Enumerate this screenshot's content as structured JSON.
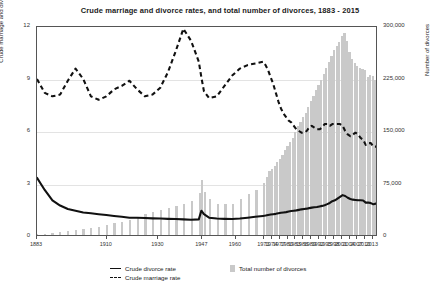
{
  "chart_data": {
    "type": "bar",
    "title": "Crude marriage and divorce rates, and total number of divorces, 1883 - 2015",
    "xlabel": "",
    "ylabel": "Crude marriage and divorce rates",
    "ylabel_right": "Number of divorces",
    "ylim": [
      0,
      12
    ],
    "ylim_right": [
      0,
      300000
    ],
    "yticks": [
      "0",
      "3",
      "6",
      "9",
      "12"
    ],
    "yticks_right": [
      "0",
      "75,000",
      "150,000",
      "225,000",
      "300,000"
    ],
    "xticks": [
      "1883",
      "1910",
      "1930",
      "1947",
      "1960",
      "1971",
      "1974",
      "1977",
      "1980",
      "1983",
      "1986",
      "1989",
      "1992",
      "1995",
      "1998",
      "2001",
      "2004",
      "2007",
      "2010",
      "2013"
    ],
    "xlim": [
      1883,
      2015
    ],
    "grid": true,
    "legend_position": "bottom",
    "colors": {
      "bars": "#c9c9c9",
      "divorce_line": "#111111",
      "marriage_line": "#111111",
      "gridline": "#e3e3e3",
      "frame": "#555555"
    },
    "legend": [
      {
        "label": "Crude divorce rate",
        "marker": "solid-line"
      },
      {
        "label": "Crude marriage rate",
        "marker": "dashed-line"
      },
      {
        "label": "Total number of divorces",
        "marker": "bar-swatch"
      }
    ],
    "x": [
      1883,
      1886,
      1889,
      1892,
      1895,
      1898,
      1901,
      1904,
      1907,
      1910,
      1913,
      1916,
      1919,
      1922,
      1925,
      1928,
      1931,
      1934,
      1937,
      1940,
      1943,
      1946,
      1947,
      1948,
      1950,
      1953,
      1956,
      1959,
      1962,
      1965,
      1968,
      1971,
      1972,
      1973,
      1974,
      1975,
      1976,
      1977,
      1978,
      1979,
      1980,
      1981,
      1982,
      1983,
      1984,
      1985,
      1986,
      1987,
      1988,
      1989,
      1990,
      1991,
      1992,
      1993,
      1994,
      1995,
      1996,
      1997,
      1998,
      1999,
      2000,
      2001,
      2002,
      2003,
      2004,
      2005,
      2006,
      2007,
      2008,
      2009,
      2010,
      2011,
      2012,
      2013,
      2014,
      2015
    ],
    "series": [
      {
        "name": "Crude divorce rate",
        "type": "line",
        "axis": "left",
        "values": [
          3.3,
          2.6,
          2.0,
          1.7,
          1.5,
          1.4,
          1.3,
          1.25,
          1.2,
          1.15,
          1.1,
          1.05,
          1.0,
          1.0,
          0.98,
          0.96,
          0.95,
          0.93,
          0.92,
          0.9,
          0.88,
          0.9,
          1.4,
          1.2,
          1.0,
          0.95,
          0.93,
          0.92,
          0.95,
          1.0,
          1.05,
          1.1,
          1.12,
          1.15,
          1.18,
          1.2,
          1.22,
          1.25,
          1.28,
          1.3,
          1.32,
          1.35,
          1.38,
          1.4,
          1.42,
          1.45,
          1.48,
          1.5,
          1.52,
          1.55,
          1.58,
          1.6,
          1.62,
          1.65,
          1.68,
          1.72,
          1.78,
          1.85,
          1.95,
          2.0,
          2.1,
          2.2,
          2.3,
          2.25,
          2.15,
          2.08,
          2.04,
          2.02,
          2.0,
          2.0,
          1.99,
          1.87,
          1.87,
          1.84,
          1.77,
          1.81
        ]
      },
      {
        "name": "Crude marriage rate",
        "type": "dashed-line",
        "axis": "left",
        "values": [
          9.0,
          8.2,
          8.0,
          8.1,
          8.9,
          9.6,
          9.0,
          8.0,
          7.8,
          8.0,
          8.4,
          8.6,
          8.9,
          8.4,
          8.0,
          8.1,
          8.5,
          9.4,
          10.6,
          11.9,
          11.2,
          10.0,
          9.1,
          8.3,
          7.9,
          8.0,
          8.6,
          9.2,
          9.6,
          9.8,
          9.9,
          10.0,
          9.8,
          9.5,
          9.1,
          8.7,
          8.2,
          7.7,
          7.3,
          7.0,
          6.8,
          6.6,
          6.5,
          6.3,
          6.1,
          6.0,
          5.9,
          5.9,
          6.0,
          6.2,
          6.3,
          6.2,
          6.1,
          6.1,
          6.2,
          6.4,
          6.4,
          6.3,
          6.4,
          6.4,
          6.4,
          6.4,
          6.3,
          6.0,
          5.8,
          5.7,
          5.8,
          5.9,
          5.8,
          5.6,
          5.5,
          5.2,
          5.3,
          5.3,
          5.1,
          5.1
        ]
      },
      {
        "name": "Total number of divorces",
        "type": "bar",
        "axis": "right",
        "values": [
          1200,
          2000,
          3000,
          4200,
          5600,
          7000,
          8500,
          10000,
          12000,
          14500,
          17000,
          19000,
          22000,
          26000,
          30000,
          33000,
          36000,
          38000,
          41000,
          44000,
          48000,
          60000,
          79000,
          62000,
          51000,
          45000,
          44000,
          45000,
          51000,
          58000,
          65000,
          74000,
          83000,
          91000,
          95000,
          99000,
          104000,
          109000,
          115000,
          121000,
          127000,
          133000,
          139000,
          147000,
          156000,
          161000,
          168000,
          175000,
          183000,
          191000,
          199000,
          207000,
          214000,
          222000,
          230000,
          239000,
          247000,
          256000,
          264000,
          270000,
          276000,
          285000,
          288000,
          277000,
          262000,
          251000,
          246000,
          242000,
          238000,
          237000,
          236000,
          226000,
          229000,
          227000,
          222000,
          225000
        ]
      }
    ]
  },
  "axis": {
    "left_label": "Crude marriage and divorce rates",
    "right_label": "Number of divorces"
  }
}
